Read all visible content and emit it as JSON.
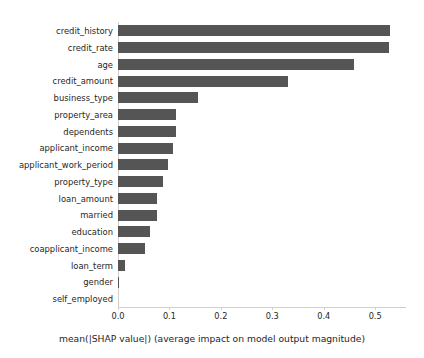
{
  "chart_data": {
    "type": "bar",
    "orientation": "horizontal",
    "title": "",
    "xlabel": "mean(|SHAP value|) (average impact on model output magnitude)",
    "ylabel": "",
    "xlim": [
      0.0,
      0.56
    ],
    "ylim": [
      0,
      17
    ],
    "grid": false,
    "legend": null,
    "bar_color": "#555555",
    "xticks": [
      "0.0",
      "0.1",
      "0.2",
      "0.3",
      "0.4",
      "0.5"
    ],
    "xtick_values": [
      0.0,
      0.1,
      0.2,
      0.3,
      0.4,
      0.5
    ],
    "categories": [
      "credit_history",
      "credit_rate",
      "age",
      "credit_amount",
      "business_type",
      "property_area",
      "dependents",
      "applicant_income",
      "applicant_work_period",
      "property_type",
      "loan_amount",
      "married",
      "education",
      "coapplicant_income",
      "loan_term",
      "gender",
      "self_employed"
    ],
    "values": [
      0.529,
      0.526,
      0.458,
      0.331,
      0.155,
      0.113,
      0.113,
      0.107,
      0.097,
      0.087,
      0.076,
      0.076,
      0.062,
      0.052,
      0.014,
      0.002,
      0.0
    ]
  },
  "caption_fragment": ""
}
